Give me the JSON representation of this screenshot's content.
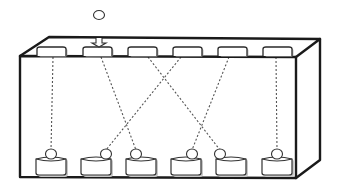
{
  "diagram": {
    "type": "box-with-slot-permutation",
    "colors": {
      "outline": "#1a1a1a",
      "dashed_link": "#555555",
      "fill": "#ffffff",
      "shadow": "#c8c8c8"
    },
    "box": {
      "front_top_left": [
        20,
        56
      ],
      "front_top_right": [
        296,
        57
      ],
      "front_bottom_left": [
        20,
        177
      ],
      "front_bottom_right": [
        296,
        178
      ],
      "back_top_left": [
        49,
        37
      ],
      "back_top_right": [
        320,
        39
      ],
      "back_bottom_right": [
        320,
        160
      ]
    },
    "incoming_token": {
      "cx": 99,
      "cy": 15,
      "r": 5
    },
    "incoming_arrow": {
      "x": 99,
      "y_top": 38,
      "y_bottom": 47
    },
    "top_slots": [
      {
        "id": 1,
        "x": 37,
        "w": 29
      },
      {
        "id": 2,
        "x": 83,
        "w": 29
      },
      {
        "id": 3,
        "x": 128,
        "w": 29
      },
      {
        "id": 4,
        "x": 173,
        "w": 29
      },
      {
        "id": 5,
        "x": 218,
        "w": 29
      },
      {
        "id": 6,
        "x": 263,
        "w": 29
      }
    ],
    "bottom_containers": [
      {
        "id": 1,
        "x": 36,
        "w": 30,
        "node_cx": 51
      },
      {
        "id": 2,
        "x": 81,
        "w": 30,
        "node_cx": 106
      },
      {
        "id": 3,
        "x": 126,
        "w": 30,
        "node_cx": 136
      },
      {
        "id": 4,
        "x": 171,
        "w": 30,
        "node_cx": 192
      },
      {
        "id": 5,
        "x": 216,
        "w": 30,
        "node_cx": 220
      },
      {
        "id": 6,
        "x": 262,
        "w": 30,
        "node_cx": 277
      }
    ],
    "links": [
      {
        "from_slot": 1,
        "to_container": 1,
        "x1": 53,
        "x2": 51
      },
      {
        "from_slot": 2,
        "to_container": 3,
        "x1": 101,
        "x2": 136
      },
      {
        "from_slot": 3,
        "to_container": 5,
        "x1": 148,
        "x2": 220
      },
      {
        "from_slot": 4,
        "to_container": 2,
        "x1": 181,
        "x2": 106
      },
      {
        "from_slot": 5,
        "to_container": 4,
        "x1": 229,
        "x2": 192
      },
      {
        "from_slot": 6,
        "to_container": 6,
        "x1": 276,
        "x2": 277
      }
    ]
  }
}
